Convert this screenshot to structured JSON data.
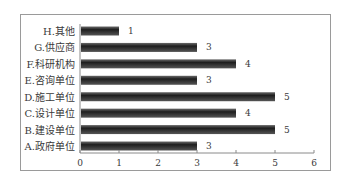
{
  "chart_data": {
    "type": "bar",
    "orientation": "horizontal",
    "title": "",
    "xlabel": "",
    "ylabel": "",
    "categories": [
      "A.政府单位",
      "B.建设单位",
      "C.设计单位",
      "D.施工单位",
      "E.咨询单位",
      "F.科研机构",
      "G.供应商",
      "H.其他"
    ],
    "values": [
      3,
      5,
      4,
      5,
      3,
      4,
      3,
      1
    ],
    "xlim": [
      0,
      6
    ],
    "xticks": [
      "0",
      "1",
      "2",
      "3",
      "4",
      "5",
      "6"
    ],
    "grid": false,
    "legend": null,
    "data_labels": true,
    "bar_color": "#2b2b2b"
  }
}
